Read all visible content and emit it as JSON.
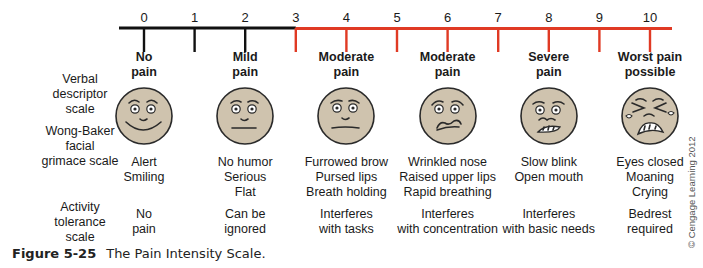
{
  "figure": {
    "label": "Figure 5-25",
    "caption": "The Pain Intensity Scale.",
    "copyright": "© Cengage Learning 2012"
  },
  "colors": {
    "low_segment": "#111111",
    "high_segment": "#e03a24",
    "face_fill": "#cfc3ae",
    "face_stroke": "#2a2a2a"
  },
  "scale": {
    "min": 0,
    "max": 10,
    "color_change_at": 3,
    "numbers": [
      "0",
      "1",
      "2",
      "3",
      "4",
      "5",
      "6",
      "7",
      "8",
      "9",
      "10"
    ]
  },
  "row_labels": {
    "verbal": [
      "Verbal",
      "descriptor",
      "scale"
    ],
    "wong_baker": [
      "Wong-Baker",
      "facial",
      "grimace scale"
    ],
    "activity": [
      "Activity",
      "tolerance",
      "scale"
    ]
  },
  "levels": [
    {
      "value": 0,
      "verbal": [
        "No",
        "pain"
      ],
      "face": "smiling-face",
      "descriptors": [
        "Alert",
        "Smiling"
      ],
      "activity": [
        "No",
        "pain"
      ]
    },
    {
      "value": 2,
      "verbal": [
        "Mild",
        "pain"
      ],
      "face": "neutral-face",
      "descriptors": [
        "No humor",
        "Serious",
        "Flat"
      ],
      "activity": [
        "Can be",
        "ignored"
      ]
    },
    {
      "value": 4,
      "verbal": [
        "Moderate",
        "pain"
      ],
      "face": "frowning-face",
      "descriptors": [
        "Furrowed brow",
        "Pursed lips",
        "Breath holding"
      ],
      "activity": [
        "Interferes",
        "with tasks"
      ]
    },
    {
      "value": 6,
      "verbal": [
        "Moderate",
        "pain"
      ],
      "face": "grimacing-face",
      "descriptors": [
        "Wrinkled nose",
        "Raised upper lips",
        "Rapid breathing"
      ],
      "activity": [
        "Interferes",
        "with concentration"
      ]
    },
    {
      "value": 8,
      "verbal": [
        "Severe",
        "pain"
      ],
      "face": "distressed-face",
      "descriptors": [
        "Slow blink",
        "Open mouth"
      ],
      "activity": [
        "Interferes",
        "with basic needs"
      ]
    },
    {
      "value": 10,
      "verbal": [
        "Worst pain",
        "possible"
      ],
      "face": "crying-face",
      "descriptors": [
        "Eyes closed",
        "Moaning",
        "Crying"
      ],
      "activity": [
        "Bedrest",
        "required"
      ]
    }
  ]
}
